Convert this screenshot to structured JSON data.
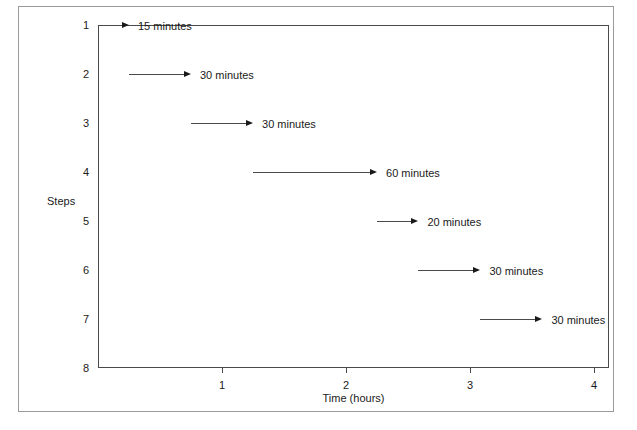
{
  "chart_data": {
    "type": "bar",
    "title": "",
    "subtitle": "",
    "xlabel": "Time (hours)",
    "ylabel": "Steps",
    "xlim": [
      0,
      4.12
    ],
    "ylim": [
      1,
      8
    ],
    "grid": false,
    "legend": null,
    "xticks": [
      {
        "value": 1,
        "label": "1"
      },
      {
        "value": 2,
        "label": "2"
      },
      {
        "value": 3,
        "label": "3"
      },
      {
        "value": 4,
        "label": "4"
      }
    ],
    "yticks": [
      {
        "value": 1,
        "label": "1"
      },
      {
        "value": 2,
        "label": "2"
      },
      {
        "value": 3,
        "label": "3"
      },
      {
        "value": 4,
        "label": "4"
      },
      {
        "value": 5,
        "label": "5"
      },
      {
        "value": 6,
        "label": "6"
      },
      {
        "value": 7,
        "label": "7"
      },
      {
        "value": 8,
        "label": "8"
      }
    ],
    "units": "hours",
    "categories": [
      "1",
      "2",
      "3",
      "4",
      "5",
      "6",
      "7"
    ],
    "values": [
      0.25,
      0.5,
      0.5,
      1.0,
      0.3333,
      0.5,
      0.5
    ],
    "tasks": [
      {
        "step": "1",
        "start_hours": 0,
        "end_hours": 0.25,
        "duration_minutes": 15,
        "annotation": "15 minutes"
      },
      {
        "step": "2",
        "start_hours": 0.25,
        "end_hours": 0.75,
        "duration_minutes": 30,
        "annotation": "30 minutes"
      },
      {
        "step": "3",
        "start_hours": 0.75,
        "end_hours": 1.25,
        "duration_minutes": 30,
        "annotation": "30 minutes"
      },
      {
        "step": "4",
        "start_hours": 1.25,
        "end_hours": 2.25,
        "duration_minutes": 60,
        "annotation": "60 minutes"
      },
      {
        "step": "5",
        "start_hours": 2.25,
        "end_hours": 2.5833,
        "duration_minutes": 20,
        "annotation": "20 minutes"
      },
      {
        "step": "6",
        "start_hours": 2.5833,
        "end_hours": 3.0833,
        "duration_minutes": 30,
        "annotation": "30 minutes"
      },
      {
        "step": "7",
        "start_hours": 3.0833,
        "end_hours": 3.5833,
        "duration_minutes": 30,
        "annotation": "30 minutes"
      }
    ]
  },
  "colors": {
    "line": "#4a4a4a",
    "arrow": "#1a1a1a",
    "text": "#1a1a1a",
    "frame": "#9a9a9a",
    "background": "#ffffff"
  }
}
